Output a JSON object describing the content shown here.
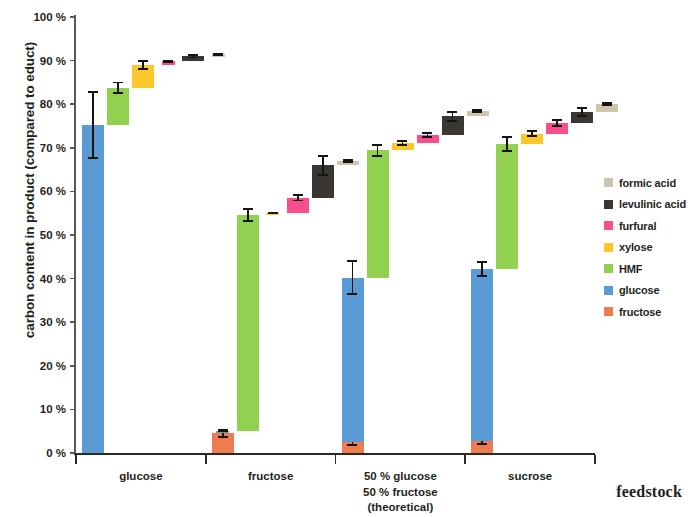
{
  "chart": {
    "type": "bar",
    "ylabel_main": "carbon content in product",
    "ylabel_sub": "(compared to educt)",
    "xlabel": "feedstock",
    "ytick_labels": [
      "100 %",
      "90 %",
      "80 %",
      "70 %",
      "60 %",
      "50 %",
      "40 %",
      "30 %",
      "20 %",
      "10 %",
      "0 %"
    ]
  },
  "legend": {
    "items": [
      {
        "label": "formic acid",
        "color": "#cdc6ad"
      },
      {
        "label": "levulinic acid",
        "color": "#3a3632"
      },
      {
        "label": "furfural",
        "color": "#f74e8d"
      },
      {
        "label": "xylose",
        "color": "#fbc82c"
      },
      {
        "label": "HMF",
        "color": "#92d050"
      },
      {
        "label": "glucose",
        "color": "#5b9bd5"
      },
      {
        "label": "fructose",
        "color": "#ed7d4e"
      }
    ]
  },
  "xaxis": {
    "groups": [
      {
        "lines": [
          "glucose"
        ]
      },
      {
        "lines": [
          "fructose"
        ]
      },
      {
        "lines": [
          "50 % glucose",
          "50 % fructose",
          "(theoretical)"
        ]
      },
      {
        "lines": [
          "sucrose"
        ]
      }
    ]
  },
  "chart_data": {
    "type": "bar",
    "subtype": "waterfall-cumulative",
    "title": "",
    "xlabel": "feedstock",
    "ylabel": "carbon content in product (compared to educt)",
    "ylim": [
      0,
      100
    ],
    "yunit": "%",
    "ytick_values": [
      0,
      10,
      20,
      30,
      40,
      50,
      60,
      70,
      80,
      90,
      100
    ],
    "grid": false,
    "legend_position": "right",
    "categories": [
      "glucose",
      "fructose",
      "50 % glucose 50 % fructose (theoretical)",
      "sucrose"
    ],
    "series_order": [
      "fructose",
      "glucose",
      "HMF",
      "xylose",
      "furfural",
      "levulinic acid",
      "formic acid"
    ],
    "series_colors": {
      "fructose": "#ed7d4e",
      "glucose": "#5b9bd5",
      "HMF": "#92d050",
      "xylose": "#fbc82c",
      "furfural": "#f74e8d",
      "levulinic acid": "#3a3632",
      "formic acid": "#cdc6ad"
    },
    "note": "Each segment is drawn as a floating bar stacked cumulatively from the previous segment's top. 'start'/'end' are cumulative % of carbon; 'value' is the segment's own contribution; 'err' is the error-bar half-width in % applied at the segment top.",
    "groups": [
      {
        "category": "glucose",
        "segments": [
          {
            "name": "fructose",
            "start": 0.0,
            "end": 0.7,
            "value": 0.7,
            "err": 0.3
          },
          {
            "name": "glucose",
            "start": 0.0,
            "end": 75.3,
            "value": 75.3,
            "err": 7.8
          },
          {
            "name": "HMF",
            "start": 75.3,
            "end": 83.8,
            "value": 8.5,
            "err": 1.4
          },
          {
            "name": "xylose",
            "start": 83.8,
            "end": 89.0,
            "value": 5.2,
            "err": 1.1
          },
          {
            "name": "furfural",
            "start": 89.0,
            "end": 89.8,
            "value": 0.8,
            "err": 0.3
          },
          {
            "name": "levulinic acid",
            "start": 89.8,
            "end": 91.0,
            "value": 1.2,
            "err": 0.5
          },
          {
            "name": "formic acid",
            "start": 91.0,
            "end": 91.4,
            "value": 0.4,
            "err": 0.2
          }
        ],
        "total": 91.4
      },
      {
        "category": "fructose",
        "segments": [
          {
            "name": "fructose",
            "start": 0.0,
            "end": 4.5,
            "value": 4.5,
            "err": 1.1
          },
          {
            "name": "glucose",
            "start": 4.5,
            "end": 5.0,
            "value": 0.5,
            "err": 0.2
          },
          {
            "name": "HMF",
            "start": 5.0,
            "end": 54.6,
            "value": 49.6,
            "err": 1.6
          },
          {
            "name": "xylose",
            "start": 54.6,
            "end": 55.1,
            "value": 0.5,
            "err": 0.2
          },
          {
            "name": "furfural",
            "start": 55.1,
            "end": 58.5,
            "value": 3.4,
            "err": 0.8
          },
          {
            "name": "levulinic acid",
            "start": 58.5,
            "end": 66.0,
            "value": 7.5,
            "err": 2.4
          },
          {
            "name": "formic acid",
            "start": 66.0,
            "end": 67.0,
            "value": 1.0,
            "err": 0.4
          }
        ],
        "total": 67.0
      },
      {
        "category": "50 % glucose 50 % fructose (theoretical)",
        "segments": [
          {
            "name": "fructose",
            "start": 0.0,
            "end": 2.5,
            "value": 2.5,
            "err": 0.8
          },
          {
            "name": "glucose",
            "start": 2.5,
            "end": 40.2,
            "value": 37.7,
            "err": 4.0
          },
          {
            "name": "HMF",
            "start": 40.2,
            "end": 69.4,
            "value": 29.2,
            "err": 1.4
          },
          {
            "name": "xylose",
            "start": 69.4,
            "end": 71.1,
            "value": 1.7,
            "err": 0.7
          },
          {
            "name": "furfural",
            "start": 71.1,
            "end": 73.0,
            "value": 1.9,
            "err": 0.7
          },
          {
            "name": "levulinic acid",
            "start": 73.0,
            "end": 77.2,
            "value": 4.2,
            "err": 1.2
          },
          {
            "name": "formic acid",
            "start": 77.2,
            "end": 78.4,
            "value": 1.2,
            "err": 0.5
          }
        ],
        "total": 78.4
      },
      {
        "category": "sucrose",
        "segments": [
          {
            "name": "fructose",
            "start": 0.0,
            "end": 2.8,
            "value": 2.8,
            "err": 0.9
          },
          {
            "name": "glucose",
            "start": 2.8,
            "end": 42.2,
            "value": 39.4,
            "err": 1.8
          },
          {
            "name": "HMF",
            "start": 42.2,
            "end": 70.9,
            "value": 28.7,
            "err": 1.8
          },
          {
            "name": "xylose",
            "start": 70.9,
            "end": 73.2,
            "value": 2.3,
            "err": 0.8
          },
          {
            "name": "furfural",
            "start": 73.2,
            "end": 75.6,
            "value": 2.4,
            "err": 0.9
          },
          {
            "name": "levulinic acid",
            "start": 75.6,
            "end": 78.2,
            "value": 2.6,
            "err": 1.1
          },
          {
            "name": "formic acid",
            "start": 78.2,
            "end": 80.1,
            "value": 1.9,
            "err": 0.4
          }
        ],
        "total": 80.1
      }
    ]
  }
}
